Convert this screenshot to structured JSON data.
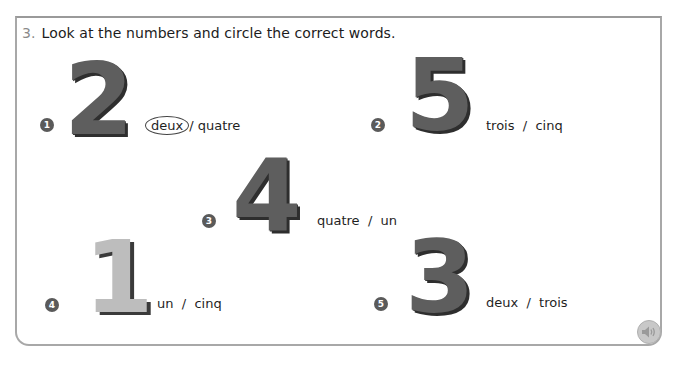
{
  "exercise": {
    "number": "3.",
    "instruction": "Look at the numbers and circle the correct words."
  },
  "items": [
    {
      "index": "1",
      "digit": "2",
      "option_a": "deux",
      "separator": "/",
      "option_b": "quatre",
      "circled": "deux"
    },
    {
      "index": "2",
      "digit": "5",
      "option_a": "trois",
      "separator": "/",
      "option_b": "cinq",
      "circled": null
    },
    {
      "index": "3",
      "digit": "4",
      "option_a": "quatre",
      "separator": "/",
      "option_b": "un",
      "circled": null
    },
    {
      "index": "4",
      "digit": "1",
      "option_a": "un",
      "separator": "/",
      "option_b": "cinq",
      "circled": null
    },
    {
      "index": "5",
      "digit": "3",
      "option_a": "deux",
      "separator": "/",
      "option_b": "trois",
      "circled": null
    }
  ],
  "audio_button": {
    "icon": "speaker-icon"
  },
  "colors": {
    "frame_border": "#a8a8a8",
    "digit_dark": "#5e5e5e",
    "digit_light": "#bdbdbd",
    "badge": "#5a5a5a"
  }
}
